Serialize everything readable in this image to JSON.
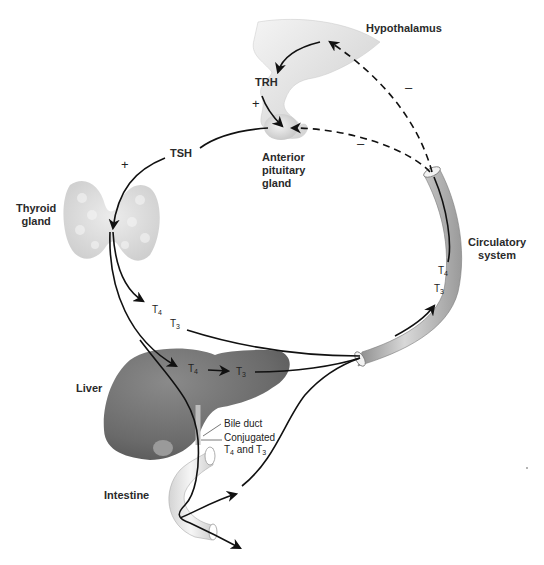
{
  "diagram": {
    "labels": {
      "hypothalamus": "Hypothalamus",
      "trh": "TRH",
      "anterior_pituitary": [
        "Anterior",
        "pituitary",
        "gland"
      ],
      "tsh": "TSH",
      "thyroid": [
        "Thyroid",
        "gland"
      ],
      "circulatory": [
        "Circulatory",
        "system"
      ],
      "liver": "Liver",
      "intestine": "Intestine",
      "bile_duct": "Bile duct",
      "conjugated": [
        "Conjugated",
        "T4 and T3"
      ]
    },
    "hormones": {
      "t4": {
        "base": "T",
        "sub": "4"
      },
      "t3": {
        "base": "T",
        "sub": "3"
      },
      "and": "and"
    },
    "signs": {
      "plus": "+",
      "minus": "–"
    },
    "nodes": [
      {
        "id": "hypothalamus",
        "label": "Hypothalamus"
      },
      {
        "id": "pituitary",
        "label": "Anterior pituitary gland"
      },
      {
        "id": "thyroid",
        "label": "Thyroid gland"
      },
      {
        "id": "circulation",
        "label": "Circulatory system"
      },
      {
        "id": "liver",
        "label": "Liver"
      },
      {
        "id": "intestine",
        "label": "Intestine"
      }
    ],
    "edges": [
      {
        "from": "hypothalamus",
        "to": "pituitary",
        "label": "TRH",
        "sign": "+",
        "style": "solid"
      },
      {
        "from": "pituitary",
        "to": "thyroid",
        "label": "TSH",
        "sign": "+",
        "style": "solid"
      },
      {
        "from": "thyroid",
        "to": "circulation",
        "label": "T4, T3",
        "style": "solid"
      },
      {
        "from": "thyroid",
        "to": "liver",
        "label": "T4",
        "style": "solid"
      },
      {
        "from": "liver",
        "to": "circulation",
        "label": "T4 → T3",
        "style": "solid"
      },
      {
        "from": "liver",
        "to": "intestine",
        "label": "Conjugated T4 and T3 via bile duct",
        "style": "solid"
      },
      {
        "from": "intestine",
        "to": "circulation",
        "label": "reabsorption",
        "style": "solid"
      },
      {
        "from": "circulation",
        "to": "hypothalamus",
        "sign": "–",
        "style": "dashed"
      },
      {
        "from": "circulation",
        "to": "pituitary",
        "sign": "–",
        "style": "dashed"
      }
    ],
    "colors": {
      "line": "#111111",
      "organ_light": "#e6e6e6",
      "liver": "#6e6e6e",
      "vessel": "#b8b8b8"
    }
  }
}
